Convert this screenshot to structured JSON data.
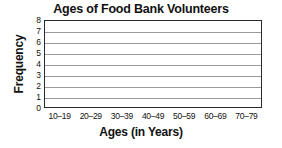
{
  "chart_data": {
    "type": "bar",
    "title": "Ages of Food Bank Volunteers",
    "subtitle": "",
    "xlabel": "Ages (in Years)",
    "ylabel": "Frequency",
    "categories": [
      "10–19",
      "20–29",
      "30–39",
      "40–49",
      "50–59",
      "60–69",
      "70–79"
    ],
    "values": [
      0,
      0,
      0,
      0,
      0,
      0,
      0
    ],
    "ylim": [
      0,
      8
    ],
    "ytick_labels": [
      "0",
      "1",
      "2",
      "3",
      "4",
      "5",
      "6",
      "7",
      "8"
    ],
    "ytick_values": [
      0,
      1,
      2,
      3,
      4,
      5,
      6,
      7,
      8
    ],
    "grid": "horizontal",
    "legend": "none",
    "annotations": [],
    "note": "blank chart template — axes and gridlines drawn, no bars plotted",
    "colors": {
      "frame": "#2b2b2b",
      "gridline": "#9a9a9a",
      "text": "#111111",
      "background": "#ffffff",
      "bar_fill": "#000000"
    }
  }
}
